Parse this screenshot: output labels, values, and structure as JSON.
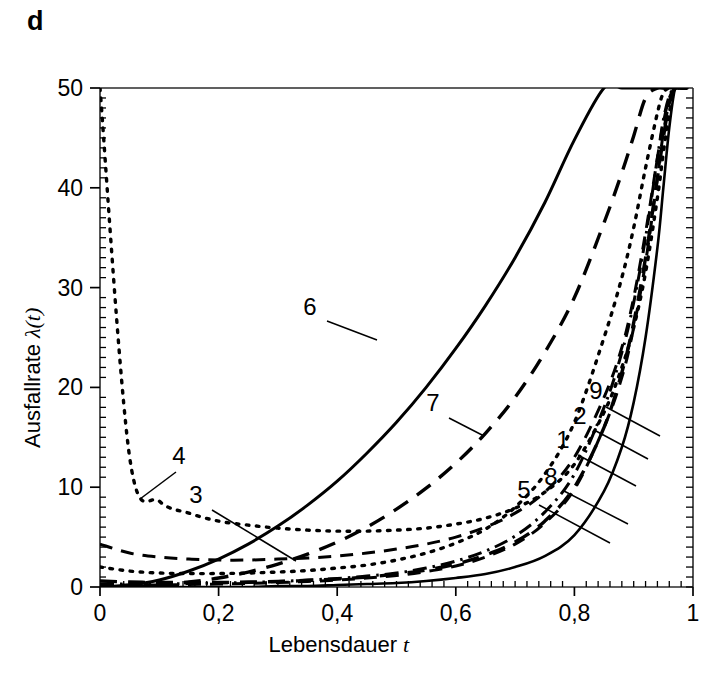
{
  "panel": {
    "label": "d"
  },
  "axes": {
    "x": {
      "title_text": "Lebensdauer",
      "title_symbol": "t",
      "ticks": [
        "0",
        "0,2",
        "0,4",
        "0,6",
        "0,8",
        "1"
      ],
      "tick_values": [
        0,
        0.2,
        0.4,
        0.6,
        0.8,
        1.0
      ],
      "range": [
        0,
        1
      ],
      "minor_per_interval": 10
    },
    "y": {
      "title_text": "Ausfallrate",
      "title_symbol": "λ(t)",
      "ticks": [
        "0",
        "10",
        "20",
        "30",
        "40",
        "50"
      ],
      "tick_values": [
        0,
        10,
        20,
        30,
        40,
        50
      ],
      "range": [
        0,
        50
      ],
      "minor_per_interval": 10
    }
  },
  "colors": {
    "ink": "#000000",
    "frame": "#2b2b2b",
    "background": "#ffffff"
  },
  "curve_labels": [
    {
      "id": "1",
      "text": "1",
      "x": 563,
      "y": 448,
      "leader": [
        [
          578,
          455
        ],
        [
          636,
          486
        ]
      ]
    },
    {
      "id": "2",
      "text": "2",
      "x": 580,
      "y": 424,
      "leader": [
        [
          596,
          431
        ],
        [
          648,
          459
        ]
      ]
    },
    {
      "id": "3",
      "text": "3",
      "x": 196,
      "y": 503,
      "leader": [
        [
          212,
          510
        ],
        [
          296,
          561
        ]
      ]
    },
    {
      "id": "4",
      "text": "4",
      "x": 179,
      "y": 464,
      "leader": [
        [
          176,
          472
        ],
        [
          140,
          499
        ]
      ]
    },
    {
      "id": "5",
      "text": "5",
      "x": 524,
      "y": 498,
      "leader": [
        [
          539,
          505
        ],
        [
          610,
          543
        ]
      ]
    },
    {
      "id": "6",
      "text": "6",
      "x": 310,
      "y": 315,
      "leader": [
        [
          327,
          321
        ],
        [
          377,
          340
        ]
      ]
    },
    {
      "id": "7",
      "text": "7",
      "x": 433,
      "y": 411,
      "leader": [
        [
          449,
          418
        ],
        [
          484,
          436
        ]
      ]
    },
    {
      "id": "8",
      "text": "8",
      "x": 551,
      "y": 485,
      "leader": [
        [
          564,
          491
        ],
        [
          628,
          524
        ]
      ]
    },
    {
      "id": "9",
      "text": "9",
      "x": 596,
      "y": 399,
      "leader": [
        [
          606,
          407
        ],
        [
          660,
          436
        ]
      ]
    }
  ],
  "chart_data": {
    "type": "line",
    "title": "",
    "subtitle": "",
    "xlabel": "Lebensdauer t",
    "ylabel": "Ausfallrate λ(t)",
    "xlim": [
      0,
      1
    ],
    "ylim": [
      0,
      50
    ],
    "xticks": [
      0,
      0.2,
      0.4,
      0.6,
      0.8,
      1.0
    ],
    "xticklabels": [
      "0",
      "0,2",
      "0,4",
      "0,6",
      "0,8",
      "1"
    ],
    "yticks": [
      0,
      10,
      20,
      30,
      40,
      50
    ],
    "yticklabels": [
      "0",
      "10",
      "20",
      "30",
      "40",
      "50"
    ],
    "grid": false,
    "legend": "inline-annotations",
    "annotations": [
      "1",
      "2",
      "3",
      "4",
      "5",
      "6",
      "7",
      "8",
      "9"
    ],
    "x": [
      0.0,
      0.05,
      0.1,
      0.15,
      0.2,
      0.25,
      0.3,
      0.35,
      0.4,
      0.45,
      0.5,
      0.55,
      0.6,
      0.65,
      0.7,
      0.75,
      0.8,
      0.85,
      0.88,
      0.9,
      0.92,
      0.94,
      0.95,
      0.96,
      0.97,
      0.98,
      0.99
    ],
    "series": [
      {
        "name": "1",
        "style": "solid-thin",
        "values": [
          0.0,
          0.0,
          0.0,
          0.0,
          0.0,
          0.0,
          0.1,
          0.1,
          0.2,
          0.3,
          0.4,
          0.6,
          0.9,
          1.3,
          2.0,
          3.1,
          5.2,
          9.6,
          14.0,
          18.5,
          25.0,
          34.0,
          40.0,
          46.0,
          50.0,
          50.0,
          50.0
        ]
      },
      {
        "name": "2",
        "style": "dash",
        "values": [
          0.6,
          0.5,
          0.45,
          0.45,
          0.45,
          0.5,
          0.55,
          0.65,
          0.8,
          1.0,
          1.3,
          1.7,
          2.3,
          3.2,
          4.5,
          6.6,
          10.0,
          16.0,
          21.5,
          26.5,
          33.0,
          41.0,
          45.0,
          48.5,
          50.0,
          50.0,
          50.0
        ]
      },
      {
        "name": "3",
        "style": "dash-sm",
        "values": [
          4.3,
          3.4,
          3.0,
          2.8,
          2.7,
          2.7,
          2.8,
          2.9,
          3.1,
          3.4,
          3.8,
          4.3,
          5.0,
          6.0,
          7.4,
          9.5,
          13.0,
          19.0,
          24.0,
          29.0,
          35.5,
          43.0,
          46.5,
          49.0,
          50.0,
          50.0,
          50.0
        ]
      },
      {
        "name": "4",
        "style": "dot",
        "values": [
          50.0,
          13.0,
          8.6,
          7.4,
          6.6,
          6.2,
          5.9,
          5.7,
          5.6,
          5.6,
          5.7,
          5.9,
          6.3,
          6.9,
          7.9,
          9.5,
          12.3,
          17.5,
          22.0,
          26.0,
          31.5,
          39.0,
          43.5,
          47.5,
          50.0,
          50.0,
          50.0
        ]
      },
      {
        "name": "5",
        "style": "dashdot",
        "values": [
          0.3,
          0.3,
          0.3,
          0.35,
          0.4,
          0.45,
          0.55,
          0.7,
          0.85,
          1.1,
          1.4,
          1.9,
          2.6,
          3.6,
          5.1,
          7.5,
          11.3,
          18.0,
          23.5,
          28.5,
          35.0,
          43.0,
          46.8,
          49.2,
          50.0,
          50.0,
          50.0
        ]
      },
      {
        "name": "6",
        "style": "solid-mid",
        "values": [
          0.0,
          0.2,
          0.7,
          1.6,
          2.8,
          4.3,
          6.1,
          8.2,
          10.6,
          13.4,
          16.5,
          20.0,
          23.9,
          28.2,
          33.0,
          38.5,
          44.8,
          50.0,
          50.0,
          50.0,
          50.0,
          50.0,
          50.0,
          50.0,
          50.0,
          50.0,
          50.0
        ]
      },
      {
        "name": "7",
        "style": "dash",
        "values": [
          0.0,
          0.05,
          0.2,
          0.5,
          0.9,
          1.5,
          2.3,
          3.3,
          4.5,
          6.0,
          7.8,
          9.9,
          12.4,
          15.4,
          19.0,
          23.5,
          29.0,
          36.5,
          41.5,
          45.2,
          49.0,
          50.0,
          50.0,
          50.0,
          50.0,
          50.0,
          50.0
        ]
      },
      {
        "name": "8",
        "style": "dash-sm",
        "values": [
          0.2,
          0.2,
          0.2,
          0.25,
          0.3,
          0.35,
          0.45,
          0.55,
          0.7,
          0.9,
          1.15,
          1.55,
          2.1,
          3.0,
          4.3,
          6.4,
          9.8,
          16.0,
          21.0,
          26.0,
          32.5,
          41.0,
          45.5,
          48.5,
          50.0,
          50.0,
          50.0
        ]
      },
      {
        "name": "9",
        "style": "dot",
        "values": [
          2.0,
          1.6,
          1.4,
          1.35,
          1.35,
          1.4,
          1.5,
          1.65,
          1.9,
          2.2,
          2.7,
          3.4,
          4.4,
          5.8,
          8.0,
          11.3,
          16.5,
          25.0,
          31.0,
          36.0,
          42.0,
          47.5,
          49.5,
          50.0,
          50.0,
          50.0,
          50.0
        ]
      }
    ]
  }
}
